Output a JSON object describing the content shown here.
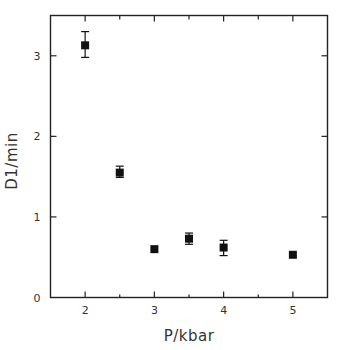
{
  "chart_data": {
    "type": "scatter",
    "title": "",
    "xlabel": "P/kbar",
    "ylabel": "D1/min",
    "xlim": [
      1.5,
      5.5
    ],
    "ylim": [
      0,
      3.5
    ],
    "xticks": [
      2,
      3,
      4,
      5
    ],
    "xticks_minor": [
      2.5,
      3.5,
      4.5
    ],
    "yticks": [
      0,
      1,
      2,
      3
    ],
    "grid": false,
    "legend": null,
    "series": [
      {
        "name": "D1",
        "marker": "square",
        "color": "#111111",
        "points": [
          {
            "x": 2.0,
            "y": 3.13,
            "err_low": 2.98,
            "err_high": 3.3
          },
          {
            "x": 2.5,
            "y": 1.55,
            "err_low": 1.49,
            "err_high": 1.63
          },
          {
            "x": 3.0,
            "y": 0.6,
            "err_low": null,
            "err_high": null
          },
          {
            "x": 3.5,
            "y": 0.73,
            "err_low": 0.66,
            "err_high": 0.8
          },
          {
            "x": 4.0,
            "y": 0.62,
            "err_low": 0.52,
            "err_high": 0.71
          },
          {
            "x": 5.0,
            "y": 0.53,
            "err_low": null,
            "err_high": null
          }
        ]
      }
    ]
  }
}
